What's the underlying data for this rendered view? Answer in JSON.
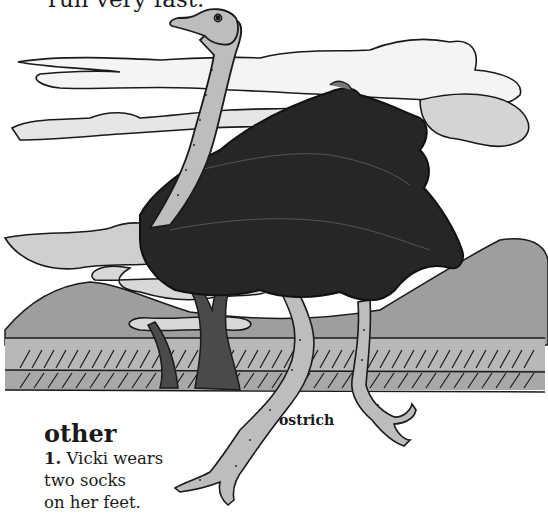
{
  "page": {
    "top_text": "run very fast."
  },
  "illustration": {
    "subject": "ostrich",
    "caption": "ostrich",
    "colors": {
      "outline": "#1a1a1a",
      "feathers": "#2a2a2a",
      "skin": "#bdbdbd",
      "cloud_shade": "#c8c8c8",
      "hill": "#9a9a9a",
      "ground": "#b0b0b0",
      "background": "#ffffff"
    }
  },
  "entry": {
    "headword": "other",
    "definition_number": "1.",
    "definition_lines": [
      "Vicki wears",
      "two socks",
      "on her feet."
    ]
  }
}
